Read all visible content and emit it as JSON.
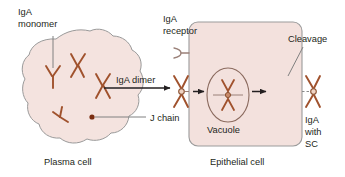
{
  "figure": {
    "labels": {
      "iga_monomer_line1": "IgA",
      "iga_monomer_line2": "monomer",
      "iga_receptor_line1": "IgA",
      "iga_receptor_line2": "receptor",
      "iga_dimer": "IgA dimer",
      "j_chain": "J chain",
      "cleavage": "Cleavage",
      "vacuole": "Vacuole",
      "plasma_cell": "Plasma cell",
      "epithelial_cell": "Epithelial cell",
      "iga_with_sc_line1": "IgA",
      "iga_with_sc_line2": "with",
      "iga_with_sc_line3": "SC"
    },
    "colors": {
      "cell_fill": "#f4e3df",
      "cell_stroke": "#9a9a9a",
      "epithelial_fill": "#f3e1dd",
      "epithelial_stroke": "#9b9b9b",
      "antibody_stroke": "#a0522d",
      "leader_line": "#808080",
      "arrow": "#231f20",
      "text": "#231f20",
      "background": "#ffffff"
    },
    "elements": {
      "plasma_cell_monomer_count": 4,
      "plasma_cell_dimer_count": 2,
      "j_chain_dot": 1,
      "vacuole_shape": "ellipse",
      "epithelial_shape": "rounded-rectangle",
      "transport_arrows": 3
    },
    "icons": {
      "antibody_monomer": "y-shape-antibody-icon",
      "antibody_dimer": "x-shape-dimer-icon",
      "receptor": "receptor-hook-icon",
      "j_chain_dot": "dot-icon",
      "arrow": "right-arrow-icon"
    }
  }
}
